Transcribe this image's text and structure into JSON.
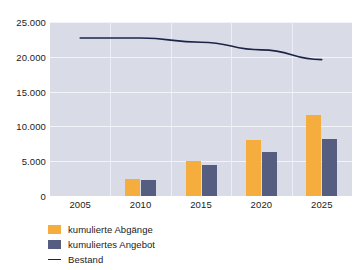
{
  "chart_data": {
    "type": "bar",
    "title": "",
    "subtitle": "",
    "xlabel": "",
    "ylabel": "",
    "categories": [
      "2005",
      "2010",
      "2015",
      "2020",
      "2025"
    ],
    "series": [
      {
        "name": "kumulierte Abgänge",
        "type": "bar",
        "color": "#f5ae3d",
        "values": [
          0,
          2400,
          5000,
          8100,
          11700
        ]
      },
      {
        "name": "kumuliertes Angebot",
        "type": "bar",
        "color": "#555e80",
        "values": [
          0,
          2350,
          4400,
          6300,
          8200
        ]
      },
      {
        "name": "Bestand",
        "type": "line",
        "color": "#1e2448",
        "values": [
          22700,
          22700,
          22100,
          21000,
          19600
        ]
      }
    ],
    "ylim": [
      0,
      25000
    ],
    "ytick_values": [
      0,
      5000,
      10000,
      15000,
      20000,
      25000
    ],
    "ytick_labels": [
      "0",
      "5.000",
      "10.000",
      "15.000",
      "20.000",
      "25.000"
    ],
    "xtick_labels": [
      "2005",
      "2010",
      "2015",
      "2020",
      "2025"
    ],
    "grid": true,
    "grid_color": "#f2f4fa",
    "plot_background": "#d9dce7",
    "figure_background": "#ffffff",
    "legend_position": "bottom-left"
  },
  "legend": {
    "items": [
      {
        "label": "kumulierte Abgänge",
        "swatch": "square",
        "color": "#f5ae3d"
      },
      {
        "label": "kumuliertes Angebot",
        "swatch": "square",
        "color": "#555e80"
      },
      {
        "label": "Bestand",
        "swatch": "line",
        "color": "#1e2448"
      }
    ]
  }
}
